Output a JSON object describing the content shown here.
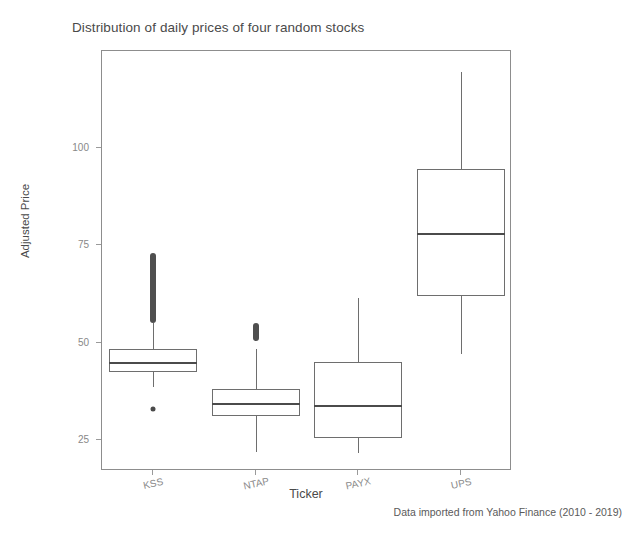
{
  "chart_data": {
    "type": "box",
    "title": "Distribution of daily prices of four random stocks",
    "xlabel": "Ticker",
    "ylabel": "Adjusted Price",
    "caption": "Data imported from Yahoo Finance (2010 - 2019)",
    "categories": [
      "KSS",
      "NTAP",
      "PAYX",
      "UPS"
    ],
    "ylim": [
      17,
      125
    ],
    "yticks": [
      25,
      50,
      75,
      100
    ],
    "ytick_labels": [
      "25",
      "50",
      "75",
      "100"
    ],
    "grid": false,
    "legend": "none",
    "boxes": [
      {
        "name": "KSS",
        "whisker_low": 38.5,
        "q1": 42.5,
        "median": 45.0,
        "q3": 48.3,
        "whisker_high": 55.0,
        "outliers_high_range": [
          55.0,
          73.0
        ],
        "outliers_low": [
          33.0
        ]
      },
      {
        "name": "NTAP",
        "whisker_low": 22.0,
        "q1": 31.2,
        "median": 34.5,
        "q3": 38.0,
        "whisker_high": 48.5,
        "outliers_high_range": [
          50.5,
          55.0
        ],
        "outliers_low": []
      },
      {
        "name": "PAYX",
        "whisker_low": 21.5,
        "q1": 25.6,
        "median": 34.0,
        "q3": 45.0,
        "whisker_high": 61.5,
        "outliers_high_range": null,
        "outliers_low": []
      },
      {
        "name": "UPS",
        "whisker_low": 47.0,
        "q1": 62.0,
        "median": 78.3,
        "q3": 94.6,
        "whisker_high": 119.5,
        "outliers_high_range": null,
        "outliers_low": []
      }
    ]
  },
  "axis": {
    "ylabel": "Adjusted Price",
    "xlabel": "Ticker",
    "ytick_0": "25",
    "ytick_1": "50",
    "ytick_2": "75",
    "ytick_3": "100",
    "xtick_0": "KSS",
    "xtick_1": "NTAP",
    "xtick_2": "PAYX",
    "xtick_3": "UPS"
  },
  "colors": {
    "line": "#6e6e6e",
    "median": "#4b4b4b",
    "outlier": "#4f4f4f",
    "text": "#4a4a4a",
    "tick_text": "#888888"
  }
}
